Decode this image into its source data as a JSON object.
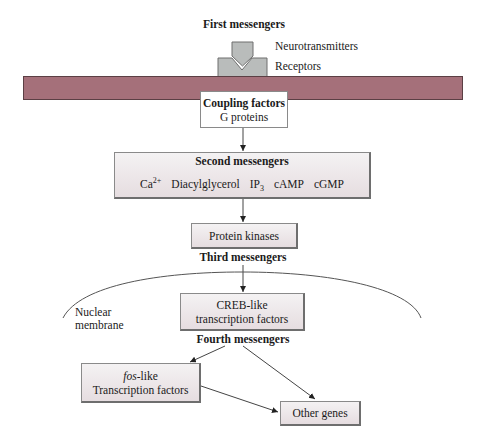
{
  "title": "First messengers",
  "first_messengers": {
    "label": "First messengers",
    "neurotransmitters_label": "Neurotransmitters",
    "receptors_label": "Receptors"
  },
  "coupling": {
    "title": "Coupling factors",
    "subtitle": "G proteins"
  },
  "second_messengers": {
    "title": "Second messengers",
    "items": [
      {
        "base": "Ca",
        "sup": "2+",
        "sub": ""
      },
      {
        "base": "Diacylglycerol",
        "sup": "",
        "sub": ""
      },
      {
        "base": "IP",
        "sup": "",
        "sub": "3"
      },
      {
        "base": "cAMP",
        "sup": "",
        "sub": ""
      },
      {
        "base": "cGMP",
        "sup": "",
        "sub": ""
      }
    ]
  },
  "protein_kinases": {
    "label": "Protein kinases"
  },
  "third_messengers": {
    "label": "Third messengers"
  },
  "nuclear_membrane": {
    "line1": "Nuclear",
    "line2": "membrane"
  },
  "creb": {
    "line1": "CREB-like",
    "line2": "transcription factors"
  },
  "fourth_messengers": {
    "label": "Fourth messengers"
  },
  "fos": {
    "italic": "fos",
    "suffix": "-like",
    "line2": "Transcription factors"
  },
  "other_genes": {
    "label": "Other genes"
  },
  "colors": {
    "membrane": "#a5707a",
    "receptor": "#b9bcbb",
    "box_fill_top": "#f4f2f3",
    "box_fill_bottom": "#e6dde0",
    "line": "#333333"
  }
}
